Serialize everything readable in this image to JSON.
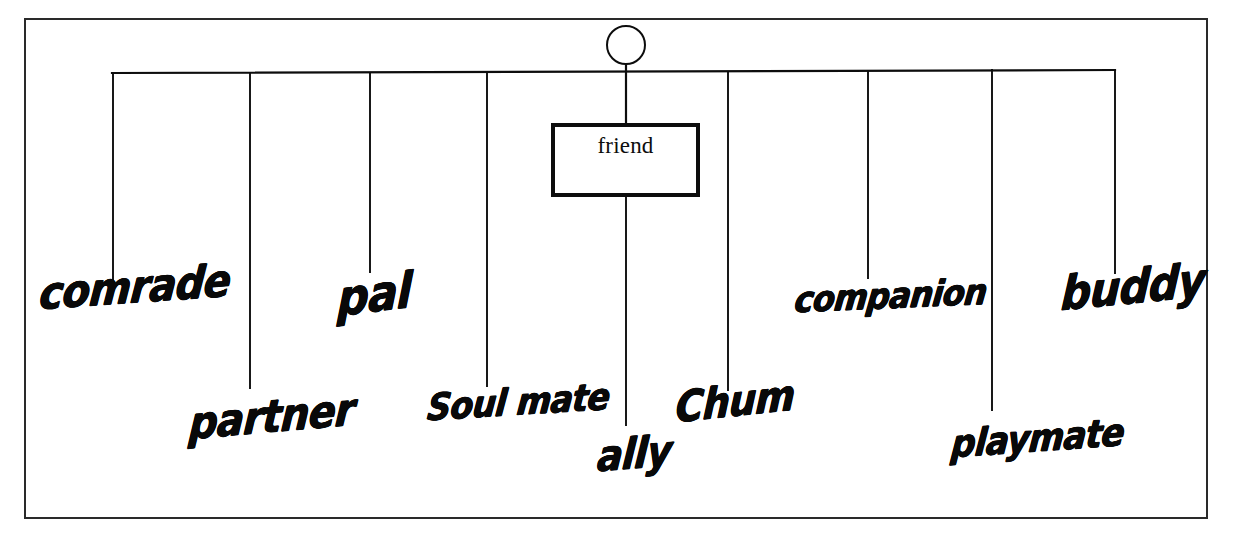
{
  "diagram": {
    "type": "word-association-network",
    "title": "friend",
    "frame": {
      "x": 25,
      "y": 19,
      "width": 1182,
      "height": 499,
      "stroke": "#2a2a2a",
      "stroke_width": 2
    },
    "ink_color": "#0d0d0d",
    "background_color": "#ffffff",
    "root_node": {
      "label": "friend",
      "shape": "rectangle",
      "x": 551,
      "y": 123,
      "width": 149,
      "height": 74,
      "border_width": 4,
      "font": "serif"
    },
    "connector_circle": {
      "name": "hub-circle",
      "cx": 626,
      "cy": 45,
      "r": 19,
      "stroke_width": 2
    },
    "bus_line": {
      "name": "horizontal-bus",
      "x1": 112,
      "y1": 73,
      "x2": 1115,
      "y2": 70
    },
    "branches": [
      {
        "label": "comrade",
        "x": 113,
        "line_top": 74,
        "line_bottom": 283,
        "label_x": 38,
        "label_y": 316,
        "font_size": 40
      },
      {
        "label": "partner",
        "x": 250,
        "line_top": 74,
        "line_bottom": 388,
        "label_x": 188,
        "label_y": 446,
        "font_size": 40
      },
      {
        "label": "pal",
        "x": 370,
        "line_top": 73,
        "line_bottom": 272,
        "label_x": 337,
        "label_y": 324,
        "font_size": 44
      },
      {
        "label": "Soul mate",
        "x": 487,
        "line_top": 73,
        "line_bottom": 386,
        "label_x": 426,
        "label_y": 426,
        "font_size": 33
      },
      {
        "label": "ally",
        "x": 626,
        "line_top": 197,
        "line_bottom": 425,
        "label_x": 596,
        "label_y": 478,
        "font_size": 38
      },
      {
        "label": "Chum",
        "x": 728,
        "line_top": 72,
        "line_bottom": 390,
        "label_x": 675,
        "label_y": 429,
        "font_size": 38
      },
      {
        "label": "companion",
        "x": 868,
        "line_top": 71,
        "line_bottom": 278,
        "label_x": 793,
        "label_y": 318,
        "font_size": 32
      },
      {
        "label": "playmate",
        "x": 992,
        "line_top": 70,
        "line_bottom": 410,
        "label_x": 950,
        "label_y": 463,
        "font_size": 34
      },
      {
        "label": "buddy",
        "x": 1115,
        "line_top": 70,
        "line_bottom": 273,
        "label_x": 1060,
        "label_y": 318,
        "font_size": 42
      }
    ]
  }
}
